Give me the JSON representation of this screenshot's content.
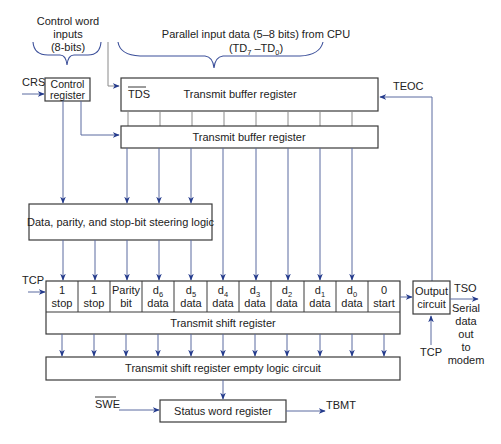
{
  "labels": {
    "control_word": [
      "Control word",
      "inputs",
      "(8-bits)"
    ],
    "parallel_input": "Parallel input data (5–8 bits) from CPU",
    "parallel_input_range": {
      "hi": "TD",
      "hi_sub": "7",
      "sep": " –TD",
      "lo_sub": "0",
      "open": "(",
      "close": ")"
    },
    "crs": "CRS",
    "teoc": "TEOC",
    "tcp_left": "TCP",
    "tcp_bottom": "TCP",
    "tso": "TSO",
    "serial_out": [
      "Serial",
      "data",
      "out",
      "to",
      "modem"
    ],
    "swe": "SWE",
    "tbmt": "TBMT"
  },
  "blocks": {
    "control_register": [
      "Control",
      "register"
    ],
    "tds": "TDS",
    "transmit_buffer_1": "Transmit buffer register",
    "transmit_buffer_2": "Transmit buffer register",
    "steering_logic": "Data, parity, and stop-bit steering logic",
    "transmit_shift_register": "Transmit shift register",
    "output_circuit": [
      "Output",
      "circuit"
    ],
    "empty_logic": "Transmit shift register empty logic circuit",
    "status_word_register": "Status word register"
  },
  "shift_cells": [
    {
      "top": "1",
      "sub": "",
      "bottom": "stop"
    },
    {
      "top": "1",
      "sub": "",
      "bottom": "stop"
    },
    {
      "top": "Parity",
      "sub": "",
      "bottom": "bit"
    },
    {
      "top": "d",
      "sub": "6",
      "bottom": "data"
    },
    {
      "top": "d",
      "sub": "5",
      "bottom": "data"
    },
    {
      "top": "d",
      "sub": "4",
      "bottom": "data"
    },
    {
      "top": "d",
      "sub": "3",
      "bottom": "data"
    },
    {
      "top": "d",
      "sub": "2",
      "bottom": "data"
    },
    {
      "top": "d",
      "sub": "1",
      "bottom": "data"
    },
    {
      "top": "d",
      "sub": "0",
      "bottom": "data"
    },
    {
      "top": "0",
      "sub": "",
      "bottom": "start"
    }
  ],
  "colors": {
    "line": "#5a6aa0",
    "arrow": "#233a8c",
    "box_stroke": "#3a3a3a"
  }
}
